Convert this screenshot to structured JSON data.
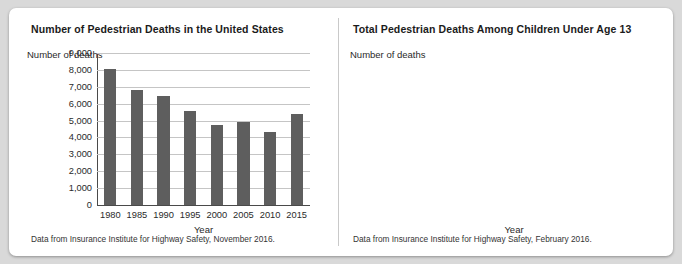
{
  "figure": {
    "background_color": "#d9d9d9",
    "card_color": "#ffffff",
    "bar_color": "#5e5e5e",
    "line_color": "#6e6e6e"
  },
  "panels": {
    "left": {
      "title": "Number of Pedestrian Deaths in the United States",
      "ylabel": "Number of deaths",
      "xlabel": "Year",
      "caption": "Data from Insurance Institute for Highway Safety, November 2016."
    },
    "right": {
      "title": "Total Pedestrian Deaths Among Children Under Age 13",
      "ylabel": "Number of deaths",
      "xlabel": "Year",
      "caption": "Data from Insurance Institute for Highway Safety, February 2016."
    }
  },
  "chart_data": [
    {
      "type": "bar",
      "title": "Number of Pedestrian Deaths in the United States",
      "xlabel": "Year",
      "ylabel": "Number of deaths",
      "categories": [
        "1980",
        "1985",
        "1990",
        "1995",
        "2000",
        "2005",
        "2010",
        "2015"
      ],
      "values": [
        8070,
        6800,
        6480,
        5580,
        4760,
        4900,
        4300,
        5400
      ],
      "ylim": [
        0,
        9000
      ],
      "yticks": [
        0,
        1000,
        2000,
        3000,
        4000,
        5000,
        6000,
        7000,
        8000,
        9000
      ],
      "ytick_labels": [
        "0",
        "1,000",
        "2,000",
        "3,000",
        "4,000",
        "5,000",
        "6,000",
        "7,000",
        "8,000",
        "9,000"
      ],
      "grid": "horizontal",
      "legend": "none",
      "bar_color": "#5e5e5e",
      "source": "Data from Insurance Institute for Highway Safety, November 2016."
    },
    {
      "type": "line",
      "title": "Total Pedestrian Deaths Among Children Under Age 13",
      "xlabel": "Year",
      "ylabel": "Number of deaths",
      "x": [
        1996,
        1998,
        2000,
        2002,
        2004,
        2006,
        2008,
        2010,
        2012,
        2014
      ],
      "values": [
        575,
        490,
        435,
        370,
        340,
        310,
        285,
        285,
        283,
        270
      ],
      "xlim": [
        1996,
        2014
      ],
      "ylim": [
        0,
        600
      ],
      "yticks": [
        0,
        100,
        200,
        300,
        400,
        500,
        600
      ],
      "ytick_labels": [
        "0",
        "100",
        "200",
        "300",
        "400",
        "500",
        "600"
      ],
      "xtick_labels": [
        "1996",
        "1998",
        "2000",
        "2002",
        "2004",
        "2006",
        "2008",
        "2010",
        "2012",
        "2014"
      ],
      "grid": "both",
      "legend": "none",
      "line_color": "#6e6e6e",
      "source": "Data from Insurance Institute for Highway Safety, February 2016."
    }
  ]
}
